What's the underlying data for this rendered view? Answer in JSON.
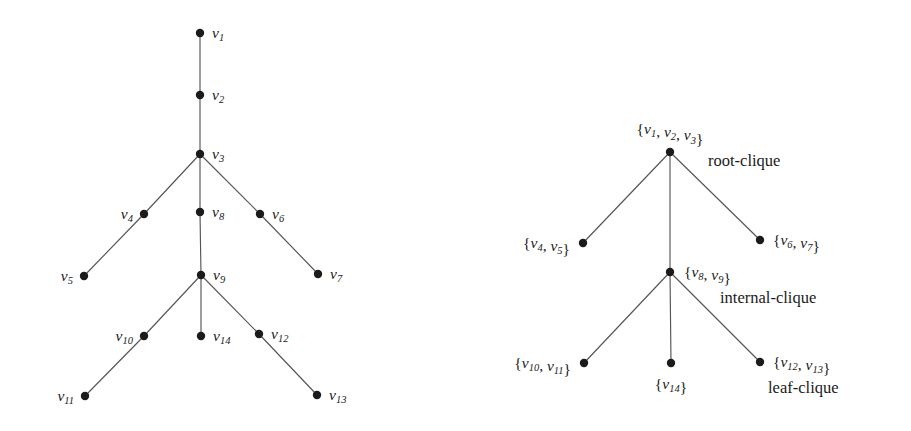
{
  "figure": {
    "background_color": "#ffffff",
    "node_color": "#1b1b1b",
    "edge_color": "#555555",
    "text_color": "#1a1a1a",
    "width": 911,
    "height": 431
  },
  "chart_data": {
    "type": "diagram",
    "title": "",
    "subtitle": "",
    "panels": [
      {
        "id": "left-panel",
        "name": "graph-tree",
        "description": "Tree of vertices v1..v14",
        "nodes": [
          {
            "id": "v1",
            "label": "v",
            "sub": "1",
            "x": 200,
            "y": 33,
            "label_x": 212,
            "label_y": 38,
            "anchor": "start"
          },
          {
            "id": "v2",
            "label": "v",
            "sub": "2",
            "x": 200,
            "y": 95,
            "label_x": 212,
            "label_y": 100,
            "anchor": "start"
          },
          {
            "id": "v3",
            "label": "v",
            "sub": "3",
            "x": 200,
            "y": 154,
            "label_x": 212,
            "label_y": 159,
            "anchor": "start"
          },
          {
            "id": "v4",
            "label": "v",
            "sub": "4",
            "x": 144,
            "y": 214,
            "label_x": 133,
            "label_y": 219,
            "anchor": "end"
          },
          {
            "id": "v5",
            "label": "v",
            "sub": "5",
            "x": 84,
            "y": 276,
            "label_x": 73,
            "label_y": 281,
            "anchor": "end"
          },
          {
            "id": "v6",
            "label": "v",
            "sub": "6",
            "x": 260,
            "y": 214,
            "label_x": 272,
            "label_y": 219,
            "anchor": "start"
          },
          {
            "id": "v7",
            "label": "v",
            "sub": "7",
            "x": 318,
            "y": 274,
            "label_x": 330,
            "label_y": 279,
            "anchor": "start"
          },
          {
            "id": "v8",
            "label": "v",
            "sub": "8",
            "x": 200,
            "y": 212,
            "label_x": 212,
            "label_y": 217,
            "anchor": "start"
          },
          {
            "id": "v9",
            "label": "v",
            "sub": "9",
            "x": 201,
            "y": 275,
            "label_x": 213,
            "label_y": 280,
            "anchor": "start"
          },
          {
            "id": "v10",
            "label": "v",
            "sub": "10",
            "x": 144,
            "y": 336,
            "label_x": 133,
            "label_y": 341,
            "anchor": "end"
          },
          {
            "id": "v11",
            "label": "v",
            "sub": "11",
            "x": 85,
            "y": 396,
            "label_x": 74,
            "label_y": 401,
            "anchor": "end"
          },
          {
            "id": "v12",
            "label": "v",
            "sub": "12",
            "x": 259,
            "y": 334,
            "label_x": 271,
            "label_y": 339,
            "anchor": "start"
          },
          {
            "id": "v13",
            "label": "v",
            "sub": "13",
            "x": 317,
            "y": 395,
            "label_x": 329,
            "label_y": 400,
            "anchor": "start"
          },
          {
            "id": "v14",
            "label": "v",
            "sub": "14",
            "x": 201,
            "y": 336,
            "label_x": 213,
            "label_y": 341,
            "anchor": "start"
          }
        ],
        "edges": [
          [
            "v1",
            "v2"
          ],
          [
            "v2",
            "v3"
          ],
          [
            "v3",
            "v4"
          ],
          [
            "v4",
            "v5"
          ],
          [
            "v3",
            "v6"
          ],
          [
            "v6",
            "v7"
          ],
          [
            "v3",
            "v8"
          ],
          [
            "v8",
            "v9"
          ],
          [
            "v9",
            "v10"
          ],
          [
            "v10",
            "v11"
          ],
          [
            "v9",
            "v14"
          ],
          [
            "v9",
            "v12"
          ],
          [
            "v12",
            "v13"
          ]
        ],
        "annotations": []
      },
      {
        "id": "right-panel",
        "name": "clique-tree",
        "description": "Clique tree of the graph",
        "nodes": [
          {
            "id": "c1",
            "label": "{v1, v2, v3}",
            "parts": [
              [
                "{",
                false
              ],
              [
                "v",
                true
              ],
              [
                "1",
                "sub"
              ],
              [
                ", ",
                false
              ],
              [
                "v",
                true
              ],
              [
                "2",
                "sub"
              ],
              [
                ", ",
                false
              ],
              [
                "v",
                true
              ],
              [
                "3",
                "sub"
              ],
              [
                "}",
                false
              ]
            ],
            "x": 670,
            "y": 152,
            "label_x": 670,
            "label_y": 134,
            "anchor": "middle"
          },
          {
            "id": "c2",
            "label": "{v4, v5}",
            "parts": [
              [
                "{",
                false
              ],
              [
                "v",
                true
              ],
              [
                "4",
                "sub"
              ],
              [
                ", ",
                false
              ],
              [
                "v",
                true
              ],
              [
                "5",
                "sub"
              ],
              [
                "}",
                false
              ]
            ],
            "x": 583,
            "y": 243,
            "label_x": 570,
            "label_y": 248,
            "anchor": "end"
          },
          {
            "id": "c3",
            "label": "{v6, v7}",
            "parts": [
              [
                "{",
                false
              ],
              [
                "v",
                true
              ],
              [
                "6",
                "sub"
              ],
              [
                ", ",
                false
              ],
              [
                "v",
                true
              ],
              [
                "7",
                "sub"
              ],
              [
                "}",
                false
              ]
            ],
            "x": 760,
            "y": 240,
            "label_x": 773,
            "label_y": 245,
            "anchor": "start"
          },
          {
            "id": "c4",
            "label": "{v8, v9}",
            "parts": [
              [
                "{",
                false
              ],
              [
                "v",
                true
              ],
              [
                "8",
                "sub"
              ],
              [
                ", ",
                false
              ],
              [
                "v",
                true
              ],
              [
                "9",
                "sub"
              ],
              [
                "}",
                false
              ]
            ],
            "x": 670,
            "y": 272,
            "label_x": 684,
            "label_y": 277,
            "anchor": "start"
          },
          {
            "id": "c5",
            "label": "{v10, v11}",
            "parts": [
              [
                "{",
                false
              ],
              [
                "v",
                true
              ],
              [
                "10",
                "sub"
              ],
              [
                ", ",
                false
              ],
              [
                "v",
                true
              ],
              [
                "11",
                "sub"
              ],
              [
                "}",
                false
              ]
            ],
            "x": 584,
            "y": 363,
            "label_x": 571,
            "label_y": 368,
            "anchor": "end"
          },
          {
            "id": "c6",
            "label": "{v14}",
            "parts": [
              [
                "{",
                false
              ],
              [
                "v",
                true
              ],
              [
                "14",
                "sub"
              ],
              [
                "}",
                false
              ]
            ],
            "x": 671,
            "y": 363,
            "label_x": 671,
            "label_y": 389,
            "anchor": "middle"
          },
          {
            "id": "c7",
            "label": "{v12, v13}",
            "parts": [
              [
                "{",
                false
              ],
              [
                "v",
                true
              ],
              [
                "12",
                "sub"
              ],
              [
                ", ",
                false
              ],
              [
                "v",
                true
              ],
              [
                "13",
                "sub"
              ],
              [
                "}",
                false
              ]
            ],
            "x": 760,
            "y": 362,
            "label_x": 773,
            "label_y": 367,
            "anchor": "start"
          }
        ],
        "edges": [
          [
            "c1",
            "c2"
          ],
          [
            "c1",
            "c3"
          ],
          [
            "c1",
            "c4"
          ],
          [
            "c4",
            "c5"
          ],
          [
            "c4",
            "c6"
          ],
          [
            "c4",
            "c7"
          ]
        ],
        "annotations": [
          {
            "id": "ann-root",
            "text": "root-clique",
            "x": 708,
            "y": 166,
            "anchor": "start"
          },
          {
            "id": "ann-internal",
            "text": "internal-clique",
            "x": 720,
            "y": 303,
            "anchor": "start"
          },
          {
            "id": "ann-leaf",
            "text": "leaf-clique",
            "x": 768,
            "y": 393,
            "anchor": "start"
          }
        ]
      }
    ],
    "node_radius": 4.2,
    "legend": [],
    "grid": false
  }
}
